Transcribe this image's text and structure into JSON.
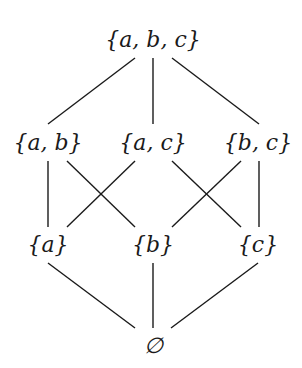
{
  "diagram": {
    "type": "hasse",
    "title": "",
    "nodes": [
      {
        "id": "abc",
        "label": "{a, b, c}",
        "x": 153,
        "y": 40
      },
      {
        "id": "ab",
        "label": "{a, b}",
        "x": 48,
        "y": 143
      },
      {
        "id": "ac",
        "label": "{a, c}",
        "x": 153,
        "y": 143
      },
      {
        "id": "bc",
        "label": "{b, c}",
        "x": 258,
        "y": 143
      },
      {
        "id": "a",
        "label": "{a}",
        "x": 48,
        "y": 245
      },
      {
        "id": "b",
        "label": "{b}",
        "x": 153,
        "y": 245
      },
      {
        "id": "c",
        "label": "{c}",
        "x": 258,
        "y": 245
      },
      {
        "id": "empty",
        "label": "∅",
        "x": 153,
        "y": 346
      }
    ],
    "edges": [
      {
        "from": "abc",
        "to": "ab",
        "x1": 135,
        "y1": 58,
        "x2": 48,
        "y2": 124
      },
      {
        "from": "abc",
        "to": "ac",
        "x1": 153,
        "y1": 58,
        "x2": 153,
        "y2": 124
      },
      {
        "from": "abc",
        "to": "bc",
        "x1": 172,
        "y1": 58,
        "x2": 259,
        "y2": 124
      },
      {
        "from": "ab",
        "to": "a",
        "x1": 48,
        "y1": 161,
        "x2": 48,
        "y2": 227
      },
      {
        "from": "ab",
        "to": "b",
        "x1": 67,
        "y1": 161,
        "x2": 135,
        "y2": 227
      },
      {
        "from": "ac",
        "to": "a",
        "x1": 135,
        "y1": 161,
        "x2": 67,
        "y2": 227
      },
      {
        "from": "ac",
        "to": "c",
        "x1": 172,
        "y1": 161,
        "x2": 241,
        "y2": 227
      },
      {
        "from": "bc",
        "to": "b",
        "x1": 241,
        "y1": 161,
        "x2": 172,
        "y2": 227
      },
      {
        "from": "bc",
        "to": "c",
        "x1": 259,
        "y1": 161,
        "x2": 259,
        "y2": 227
      },
      {
        "from": "a",
        "to": "empty",
        "x1": 48,
        "y1": 263,
        "x2": 135,
        "y2": 328
      },
      {
        "from": "b",
        "to": "empty",
        "x1": 153,
        "y1": 263,
        "x2": 153,
        "y2": 328
      },
      {
        "from": "c",
        "to": "empty",
        "x1": 258,
        "y1": 263,
        "x2": 171,
        "y2": 328
      }
    ],
    "line_color": "#1a1a1a"
  }
}
